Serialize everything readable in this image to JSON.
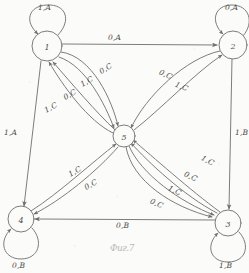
{
  "diagram": {
    "caption": "Фиг.7",
    "stroke_color": "#6e6e6e",
    "text_color": "#4a4a4a",
    "paper_color": "#fbfbf9",
    "nodes": [
      {
        "id": "1",
        "label": "1",
        "cx": 47,
        "cy": 46,
        "r": 15
      },
      {
        "id": "2",
        "label": "2",
        "cx": 233,
        "cy": 45,
        "r": 14
      },
      {
        "id": "3",
        "label": "3",
        "cx": 228,
        "cy": 223,
        "r": 13
      },
      {
        "id": "4",
        "label": "4",
        "cx": 21,
        "cy": 219,
        "r": 13
      },
      {
        "id": "5",
        "label": "5",
        "cx": 124,
        "cy": 136,
        "r": 11
      }
    ],
    "self_loops": [
      {
        "node": "1",
        "label": "1,A",
        "label_x": 38,
        "label_y": 3,
        "side": "top"
      },
      {
        "node": "2",
        "label": "0,A",
        "label_x": 225,
        "label_y": 3,
        "side": "top"
      },
      {
        "node": "3",
        "label": "1,B",
        "label_x": 219,
        "label_y": 261,
        "side": "bottom"
      },
      {
        "node": "4",
        "label": "0,B",
        "label_x": 12,
        "label_y": 261,
        "side": "bottom"
      }
    ],
    "edges": [
      {
        "from": "1",
        "to": "2",
        "label": "0,A",
        "label_x": 108,
        "label_y": 33
      },
      {
        "from": "1",
        "to": "4",
        "label": "1,A",
        "label_x": 4,
        "label_y": 128
      },
      {
        "from": "2",
        "to": "3",
        "label": "1,B",
        "label_x": 235,
        "label_y": 128
      },
      {
        "from": "3",
        "to": "4",
        "label": "0,B",
        "label_x": 116,
        "label_y": 221
      },
      {
        "from": "1",
        "to": "5",
        "label": "0,C",
        "label_x": 99,
        "label_y": 64
      },
      {
        "from": "1",
        "to": "5",
        "label": "1,C",
        "label_x": 80,
        "label_y": 77
      },
      {
        "from": "5",
        "to": "1",
        "label": "0,C",
        "label_x": 63,
        "label_y": 90
      },
      {
        "from": "5",
        "to": "1",
        "label": "1,C",
        "label_x": 44,
        "label_y": 103
      },
      {
        "from": "2",
        "to": "5",
        "label": "0,C",
        "label_x": 159,
        "label_y": 70
      },
      {
        "from": "5",
        "to": "2",
        "label": "1,C",
        "label_x": 175,
        "label_y": 82
      },
      {
        "from": "4",
        "to": "5",
        "label": "1,C",
        "label_x": 68,
        "label_y": 167
      },
      {
        "from": "5",
        "to": "4",
        "label": "0,C",
        "label_x": 84,
        "label_y": 180
      },
      {
        "from": "3",
        "to": "5",
        "label": "1,C",
        "label_x": 201,
        "label_y": 156
      },
      {
        "from": "5",
        "to": "3",
        "label": "0,C",
        "label_x": 184,
        "label_y": 172
      },
      {
        "from": "3",
        "to": "5",
        "label": "1,C",
        "label_x": 168,
        "label_y": 186
      },
      {
        "from": "5",
        "to": "3",
        "label": "0,C",
        "label_x": 150,
        "label_y": 199
      }
    ]
  }
}
